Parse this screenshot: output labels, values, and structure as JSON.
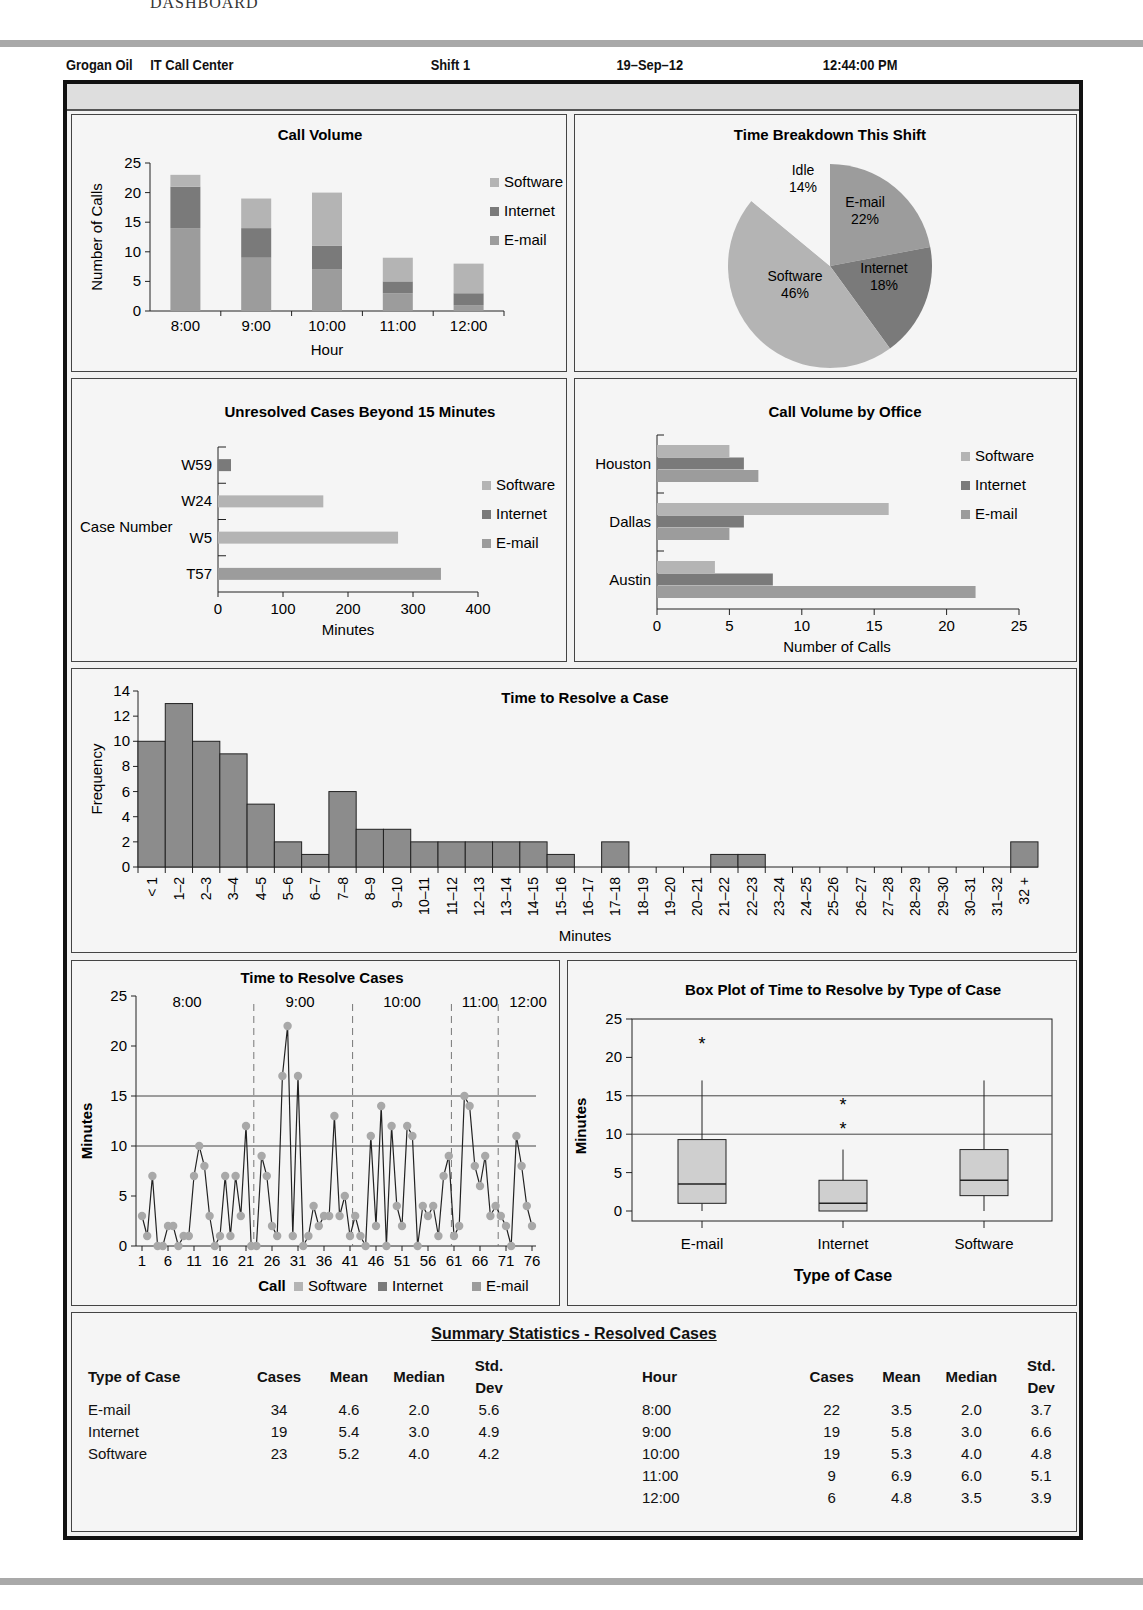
{
  "page": {
    "header_text": "DASHBOARD"
  },
  "topbar": {
    "company": "Grogan Oil",
    "department": "IT Call Center",
    "shift": "Shift 1",
    "date": "19–Sep–12",
    "time": "12:44:00 PM"
  },
  "colors": {
    "software": "#b4b4b4",
    "internet": "#7a7a7a",
    "email": "#9c9c9c",
    "idle": "#f5f5f5",
    "hist_bar": "#8c8c8c",
    "box_fill": "#cfcfcf",
    "point": "#a8a8a8"
  },
  "legend": {
    "software": "Software",
    "internet": "Internet",
    "email": "E-mail"
  },
  "chart_data": [
    {
      "id": "call_volume",
      "type": "bar",
      "stacked": true,
      "title": "Call Volume",
      "xlabel": "Hour",
      "ylabel": "Number of Calls",
      "ylim": [
        0,
        25
      ],
      "yticks": [
        0,
        5,
        10,
        15,
        20,
        25
      ],
      "categories": [
        "8:00",
        "9:00",
        "10:00",
        "11:00",
        "12:00"
      ],
      "series": [
        {
          "name": "E-mail",
          "values": [
            14,
            9,
            7,
            3,
            1
          ]
        },
        {
          "name": "Internet",
          "values": [
            7,
            5,
            4,
            2,
            2
          ]
        },
        {
          "name": "Software",
          "values": [
            2,
            5,
            9,
            4,
            5
          ]
        }
      ],
      "legend_position": "right"
    },
    {
      "id": "time_breakdown",
      "type": "pie",
      "title": "Time Breakdown This Shift",
      "labels": [
        "E-mail",
        "Internet",
        "Software",
        "Idle"
      ],
      "values": [
        22,
        18,
        46,
        14
      ],
      "value_labels": [
        "22%",
        "18%",
        "46%",
        "14%"
      ]
    },
    {
      "id": "unresolved",
      "type": "bar",
      "orientation": "horizontal",
      "title": "Unresolved Cases Beyond 15 Minutes",
      "xlabel": "Minutes",
      "ylabel": "Case Number",
      "xlim": [
        0,
        400
      ],
      "xticks": [
        0,
        100,
        200,
        300,
        400
      ],
      "categories": [
        "W59",
        "W24",
        "W5",
        "T57"
      ],
      "values": [
        20,
        162,
        277,
        343
      ],
      "types": [
        "Internet",
        "Software",
        "Software",
        "E-mail"
      ],
      "legend_position": "right"
    },
    {
      "id": "office_volume",
      "type": "bar",
      "orientation": "horizontal",
      "title": "Call Volume by Office",
      "xlabel": "Number of Calls",
      "xlim": [
        0,
        25
      ],
      "xticks": [
        0,
        5,
        10,
        15,
        20,
        25
      ],
      "categories": [
        "Houston",
        "Dallas",
        "Austin"
      ],
      "series": [
        {
          "name": "Software",
          "values": [
            5,
            16,
            4
          ]
        },
        {
          "name": "Internet",
          "values": [
            6,
            6,
            8
          ]
        },
        {
          "name": "E-mail",
          "values": [
            7,
            5,
            22
          ]
        }
      ],
      "legend_position": "right"
    },
    {
      "id": "histogram",
      "type": "bar",
      "title": "Time to Resolve a Case",
      "xlabel": "Minutes",
      "ylabel": "Frequency",
      "ylim": [
        0,
        14
      ],
      "yticks": [
        0,
        2,
        4,
        6,
        8,
        10,
        12,
        14
      ],
      "categories": [
        "< 1",
        "1–2",
        "2–3",
        "3–4",
        "4–5",
        "5–6",
        "6–7",
        "7–8",
        "8–9",
        "9–10",
        "10–11",
        "11–12",
        "12–13",
        "13–14",
        "14–15",
        "15–16",
        "16–17",
        "17–18",
        "18–19",
        "19–20",
        "20–21",
        "21–22",
        "22–23",
        "23–24",
        "24–25",
        "25–26",
        "26–27",
        "27–28",
        "28–29",
        "29–30",
        "30–31",
        "31–32",
        "32 +"
      ],
      "values": [
        10,
        13,
        10,
        9,
        5,
        2,
        1,
        6,
        3,
        3,
        2,
        2,
        2,
        2,
        2,
        1,
        0,
        2,
        0,
        0,
        0,
        1,
        1,
        0,
        0,
        0,
        0,
        0,
        0,
        0,
        0,
        0,
        2
      ]
    },
    {
      "id": "run_chart",
      "type": "line",
      "title": "Time to Resolve Cases",
      "xlabel": "Call",
      "ylabel": "Minutes",
      "ylim": [
        0,
        25
      ],
      "yticks": [
        0,
        5,
        10,
        15,
        20,
        25
      ],
      "xticks": [
        1,
        6,
        11,
        16,
        21,
        26,
        31,
        36,
        41,
        46,
        51,
        56,
        61,
        66,
        71,
        76
      ],
      "reference_lines": [
        10,
        15
      ],
      "hour_labels": [
        "8:00",
        "9:00",
        "10:00",
        "11:00",
        "12:00"
      ],
      "hour_dividers": [
        23,
        42,
        61,
        70
      ],
      "x": [
        1,
        2,
        3,
        4,
        5,
        6,
        7,
        8,
        9,
        10,
        11,
        12,
        13,
        14,
        15,
        16,
        17,
        18,
        19,
        20,
        21,
        22,
        23,
        24,
        25,
        26,
        27,
        28,
        29,
        30,
        31,
        32,
        33,
        34,
        35,
        36,
        37,
        38,
        39,
        40,
        41,
        42,
        43,
        44,
        45,
        46,
        47,
        48,
        49,
        50,
        51,
        52,
        53,
        54,
        55,
        56,
        57,
        58,
        59,
        60,
        61,
        62,
        63,
        64,
        65,
        66,
        67,
        68,
        69,
        70,
        71,
        72,
        73,
        74,
        75,
        76
      ],
      "y": [
        3,
        1,
        7,
        0,
        0,
        2,
        2,
        0,
        1,
        1,
        7,
        10,
        8,
        3,
        0,
        1,
        7,
        1,
        7,
        3,
        12,
        0,
        0,
        9,
        7,
        2,
        1,
        17,
        22,
        1,
        17,
        0,
        1,
        4,
        2,
        3,
        3,
        13,
        3,
        5,
        1,
        3,
        1,
        0,
        11,
        2,
        14,
        0,
        12,
        4,
        2,
        12,
        11,
        0,
        4,
        3,
        4,
        1,
        7,
        9,
        1,
        2,
        15,
        14,
        8,
        6,
        9,
        3,
        4,
        3,
        2,
        0,
        11,
        8,
        4,
        2
      ],
      "legend": [
        "Software",
        "Internet",
        "E-mail"
      ]
    },
    {
      "id": "box_plot",
      "type": "box",
      "title": "Box Plot of Time to Resolve by Type of Case",
      "xlabel": "Type of Case",
      "ylabel": "Minutes",
      "ylim": [
        0,
        25
      ],
      "yticks": [
        0,
        5,
        10,
        15,
        20,
        25
      ],
      "reference_lines": [
        10,
        15
      ],
      "categories": [
        "E-mail",
        "Internet",
        "Software"
      ],
      "boxes": [
        {
          "min": 0,
          "q1": 1,
          "median": 3.5,
          "q3": 9.3,
          "max": 17,
          "outliers": [
            22
          ]
        },
        {
          "min": 0,
          "q1": 0,
          "median": 1,
          "q3": 4,
          "max": 8,
          "outliers": [
            11,
            14
          ]
        },
        {
          "min": 0,
          "q1": 2,
          "median": 4,
          "q3": 8,
          "max": 17,
          "outliers": []
        }
      ]
    }
  ],
  "summary": {
    "title": "Summary Statistics - Resolved Cases",
    "by_type": {
      "headers": [
        "Type of Case",
        "Cases",
        "Mean",
        "Median",
        "Std. Dev"
      ],
      "rows": [
        [
          "E-mail",
          "34",
          "4.6",
          "2.0",
          "5.6"
        ],
        [
          "Internet",
          "19",
          "5.4",
          "3.0",
          "4.9"
        ],
        [
          "Software",
          "23",
          "5.2",
          "4.0",
          "4.2"
        ]
      ]
    },
    "by_hour": {
      "headers": [
        "Hour",
        "Cases",
        "Mean",
        "Median",
        "Std. Dev"
      ],
      "rows": [
        [
          "8:00",
          "22",
          "3.5",
          "2.0",
          "3.7"
        ],
        [
          "9:00",
          "19",
          "5.8",
          "3.0",
          "6.6"
        ],
        [
          "10:00",
          "19",
          "5.3",
          "4.0",
          "4.8"
        ],
        [
          "11:00",
          "9",
          "6.9",
          "6.0",
          "5.1"
        ],
        [
          "12:00",
          "6",
          "4.8",
          "3.5",
          "3.9"
        ]
      ]
    }
  }
}
